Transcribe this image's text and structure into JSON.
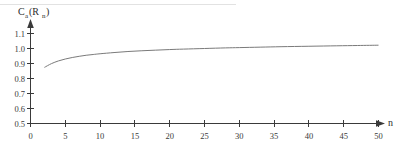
{
  "chart_data": {
    "type": "line",
    "title": "",
    "subtitle": "",
    "ylabel": "C_a(R_n)",
    "ylabel_parts": {
      "main": "C",
      "subscript": "a",
      "arg_open": "(R",
      "arg_subscript": "n",
      "arg_close": ")"
    },
    "xlabel": "n",
    "xlim": [
      0,
      50
    ],
    "ylim": [
      0.5,
      1.15
    ],
    "grid": false,
    "legend": null,
    "xticks": [
      0,
      5,
      10,
      15,
      20,
      25,
      30,
      35,
      40,
      45,
      50
    ],
    "xtick_labels": [
      "0",
      "5",
      "10",
      "15",
      "20",
      "25",
      "30",
      "35",
      "40",
      "45",
      "50"
    ],
    "yticks": [
      0.5,
      0.6,
      0.7,
      0.8,
      0.9,
      1.0,
      1.1
    ],
    "ytick_labels": [
      "0.5",
      "0.6",
      "0.7",
      "0.8",
      "0.9",
      "1.0",
      "1.1"
    ],
    "series": [
      {
        "name": "C_a(R_n)",
        "color": "#7a7a7a",
        "x": [
          2,
          3,
          4,
          5,
          6,
          7,
          8,
          9,
          10,
          12,
          14,
          16,
          18,
          20,
          22,
          25,
          28,
          30,
          33,
          36,
          40,
          44,
          47,
          50
        ],
        "y": [
          0.874,
          0.899,
          0.917,
          0.93,
          0.94,
          0.948,
          0.955,
          0.96,
          0.965,
          0.973,
          0.98,
          0.985,
          0.989,
          0.993,
          0.996,
          1.0,
          1.004,
          1.006,
          1.009,
          1.012,
          1.015,
          1.018,
          1.02,
          1.022
        ]
      }
    ],
    "annotations": []
  },
  "axis_style": {
    "axis_color": "#3a3a3a",
    "curve_color": "#7a7a7a",
    "background": "#ffffff",
    "arrow_x_label": "n",
    "has_x_arrow": true,
    "has_y_arrow": true
  }
}
